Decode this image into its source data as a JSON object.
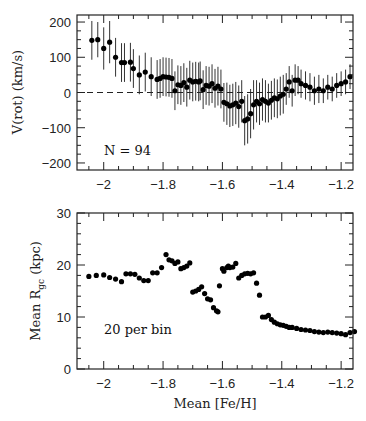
{
  "chart_data": [
    {
      "id": "top",
      "type": "scatter",
      "title": "",
      "xlabel": "",
      "ylabel": "V(rot) (km/s)",
      "xlim": [
        -2.09,
        -1.16
      ],
      "ylim": [
        -220,
        220
      ],
      "xticks": [
        -2,
        -1.8,
        -1.6,
        -1.4,
        -1.2
      ],
      "xtick_labels": [
        "−2",
        "−1.8",
        "−1.6",
        "−1.4",
        "−1.2"
      ],
      "yticks": [
        -200,
        -100,
        0,
        100,
        200
      ],
      "ytick_labels": [
        "−200",
        "−100",
        "0",
        "100",
        "200"
      ],
      "reference_line": {
        "y": 0,
        "style": "dashed"
      },
      "annotation": "N = 94",
      "error_bars": true,
      "series": [
        {
          "name": "V(rot)",
          "x": [
            -2.04,
            -2.02,
            -2.0,
            -1.98,
            -1.96,
            -1.94,
            -1.93,
            -1.91,
            -1.9,
            -1.88,
            -1.86,
            -1.84,
            -1.82,
            -1.81,
            -1.8,
            -1.79,
            -1.78,
            -1.77,
            -1.76,
            -1.75,
            -1.74,
            -1.73,
            -1.72,
            -1.71,
            -1.7,
            -1.69,
            -1.68,
            -1.675,
            -1.665,
            -1.655,
            -1.645,
            -1.635,
            -1.625,
            -1.615,
            -1.605,
            -1.595,
            -1.585,
            -1.575,
            -1.565,
            -1.555,
            -1.545,
            -1.535,
            -1.525,
            -1.515,
            -1.505,
            -1.495,
            -1.485,
            -1.475,
            -1.465,
            -1.455,
            -1.445,
            -1.435,
            -1.425,
            -1.415,
            -1.405,
            -1.395,
            -1.385,
            -1.375,
            -1.365,
            -1.355,
            -1.345,
            -1.335,
            -1.32,
            -1.305,
            -1.29,
            -1.275,
            -1.26,
            -1.245,
            -1.23,
            -1.215,
            -1.2,
            -1.185,
            -1.17
          ],
          "y": [
            148,
            150,
            125,
            143,
            100,
            85,
            85,
            86,
            68,
            50,
            58,
            45,
            37,
            40,
            45,
            44,
            43,
            40,
            5,
            22,
            20,
            28,
            15,
            35,
            30,
            32,
            30,
            33,
            8,
            20,
            18,
            25,
            12,
            18,
            10,
            -28,
            -32,
            -38,
            -35,
            -30,
            -40,
            -25,
            -80,
            -75,
            -60,
            -35,
            -25,
            -32,
            -20,
            -25,
            -30,
            -22,
            -15,
            -18,
            -10,
            -5,
            10,
            30,
            5,
            35,
            35,
            25,
            20,
            15,
            5,
            10,
            5,
            15,
            10,
            20,
            25,
            30,
            45
          ],
          "yerr": [
            55,
            50,
            60,
            60,
            55,
            55,
            55,
            55,
            55,
            55,
            55,
            55,
            55,
            55,
            55,
            55,
            55,
            55,
            55,
            55,
            55,
            55,
            55,
            55,
            55,
            55,
            55,
            55,
            55,
            55,
            55,
            55,
            55,
            55,
            55,
            55,
            60,
            60,
            60,
            60,
            60,
            60,
            70,
            70,
            70,
            70,
            60,
            60,
            60,
            60,
            55,
            55,
            55,
            55,
            55,
            55,
            45,
            45,
            45,
            45,
            40,
            40,
            40,
            40,
            40,
            40,
            35,
            35,
            35,
            35,
            35,
            35,
            35
          ]
        }
      ]
    },
    {
      "id": "bottom",
      "type": "scatter",
      "title": "",
      "xlabel": "Mean [Fe/H]",
      "ylabel": "Mean R_gc (kpc)",
      "xlim": [
        -2.09,
        -1.16
      ],
      "ylim": [
        0,
        30
      ],
      "xticks": [
        -2,
        -1.8,
        -1.6,
        -1.4,
        -1.2
      ],
      "xtick_labels": [
        "−2",
        "−1.8",
        "−1.6",
        "−1.4",
        "−1.2"
      ],
      "yticks": [
        0,
        10,
        20,
        30
      ],
      "ytick_labels": [
        "0",
        "10",
        "20",
        "30"
      ],
      "annotation": "20 per bin",
      "series": [
        {
          "name": "Mean R_gc",
          "x": [
            -2.05,
            -2.025,
            -2.0,
            -1.98,
            -1.96,
            -1.94,
            -1.925,
            -1.91,
            -1.895,
            -1.88,
            -1.865,
            -1.85,
            -1.835,
            -1.82,
            -1.805,
            -1.79,
            -1.78,
            -1.77,
            -1.76,
            -1.75,
            -1.74,
            -1.73,
            -1.72,
            -1.71,
            -1.7,
            -1.69,
            -1.68,
            -1.67,
            -1.66,
            -1.65,
            -1.64,
            -1.63,
            -1.62,
            -1.615,
            -1.61,
            -1.6,
            -1.595,
            -1.585,
            -1.58,
            -1.575,
            -1.565,
            -1.555,
            -1.545,
            -1.535,
            -1.525,
            -1.515,
            -1.505,
            -1.495,
            -1.485,
            -1.475,
            -1.465,
            -1.455,
            -1.445,
            -1.435,
            -1.425,
            -1.415,
            -1.405,
            -1.395,
            -1.385,
            -1.375,
            -1.365,
            -1.35,
            -1.335,
            -1.32,
            -1.305,
            -1.29,
            -1.275,
            -1.26,
            -1.245,
            -1.23,
            -1.215,
            -1.2,
            -1.185,
            -1.17,
            -1.155
          ],
          "y": [
            17.8,
            18.0,
            18.1,
            17.6,
            17.3,
            16.8,
            18.3,
            18.3,
            18.2,
            17.5,
            17.0,
            17.0,
            18.5,
            18.5,
            19.5,
            22.0,
            21.0,
            20.8,
            20.3,
            20.6,
            19.3,
            19.5,
            19.8,
            20.4,
            14.8,
            15.0,
            15.3,
            15.8,
            14.5,
            13.5,
            13.3,
            11.8,
            11.2,
            11.0,
            16.0,
            19.3,
            18.8,
            19.5,
            19.8,
            19.5,
            19.6,
            20.3,
            17.5,
            18.0,
            18.3,
            18.4,
            18.3,
            18.5,
            16.5,
            14.2,
            10.0,
            10.0,
            10.3,
            9.5,
            9.0,
            8.7,
            8.5,
            8.4,
            8.2,
            8.0,
            8.0,
            7.8,
            7.6,
            7.5,
            7.4,
            7.2,
            7.1,
            7.0,
            7.1,
            7.0,
            6.9,
            6.8,
            6.6,
            7.0,
            7.2
          ]
        }
      ]
    }
  ]
}
